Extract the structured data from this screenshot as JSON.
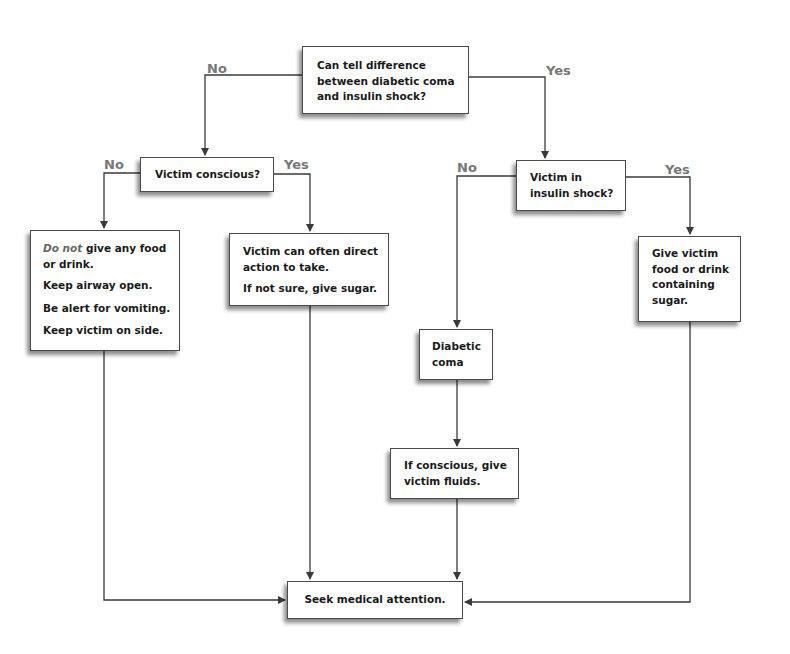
{
  "diagram": {
    "type": "flowchart",
    "nodes": {
      "start": {
        "text": [
          "Can tell difference",
          "between diabetic coma",
          "and insulin shock?"
        ]
      },
      "conscious": {
        "text": "Victim conscious?"
      },
      "unconscious_care": {
        "line1_em": "Do not",
        "line1_rest": " give any food",
        "line2": "or drink.",
        "line3": "Keep airway open.",
        "line4": "Be alert for vomiting.",
        "line5": "Keep victim on side."
      },
      "conscious_care": {
        "line1": "Victim can often direct",
        "line2": "action to take.",
        "line3": "If not sure, give sugar."
      },
      "insulin_shock": {
        "text": [
          "Victim in",
          "insulin shock?"
        ]
      },
      "give_sugar": {
        "text": [
          "Give victim",
          "food or drink",
          "containing",
          "sugar."
        ]
      },
      "diabetic_coma": {
        "text": [
          "Diabetic",
          "coma"
        ]
      },
      "fluids": {
        "text": [
          "If conscious, give",
          "victim fluids."
        ]
      },
      "seek": {
        "text": "Seek medical attention."
      }
    },
    "labels": {
      "start_no": "No",
      "start_yes": "Yes",
      "conscious_no": "No",
      "conscious_yes": "Yes",
      "shock_no": "No",
      "shock_yes": "Yes"
    },
    "edges": [
      {
        "from": "start",
        "to": "conscious",
        "label": "No"
      },
      {
        "from": "start",
        "to": "insulin_shock",
        "label": "Yes"
      },
      {
        "from": "conscious",
        "to": "unconscious_care",
        "label": "No"
      },
      {
        "from": "conscious",
        "to": "conscious_care",
        "label": "Yes"
      },
      {
        "from": "insulin_shock",
        "to": "diabetic_coma",
        "label": "No"
      },
      {
        "from": "insulin_shock",
        "to": "give_sugar",
        "label": "Yes"
      },
      {
        "from": "diabetic_coma",
        "to": "fluids"
      },
      {
        "from": "fluids",
        "to": "seek"
      },
      {
        "from": "conscious_care",
        "to": "seek"
      },
      {
        "from": "unconscious_care",
        "to": "seek"
      },
      {
        "from": "give_sugar",
        "to": "seek"
      }
    ],
    "colors": {
      "line": "#3a3a3a",
      "label": "#777777",
      "text": "#1a1a1a"
    }
  }
}
